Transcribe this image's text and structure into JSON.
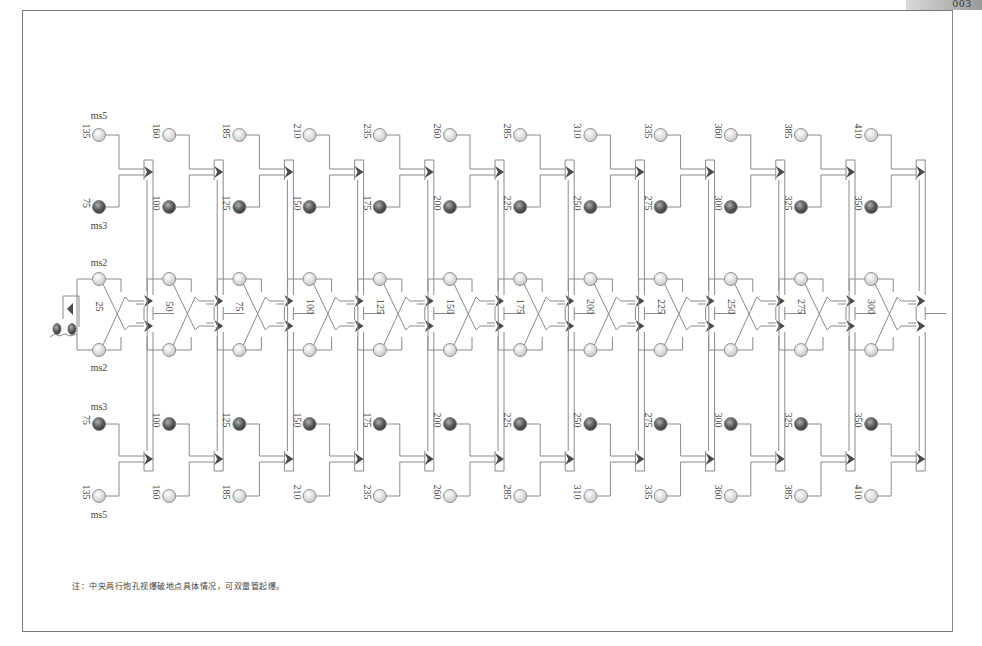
{
  "page": {
    "corner_tab": "003"
  },
  "diagram": {
    "type": "blasting-detonation-network",
    "column_count": 12,
    "delay_labels": {
      "top_outer": "ms5",
      "top_inner": "ms3",
      "center_top": "ms2",
      "center_bottom": "ms2",
      "bottom_inner": "ms3",
      "bottom_outer": "ms5"
    },
    "columns": [
      {
        "outer": "135",
        "inner": "75",
        "center": "25"
      },
      {
        "outer": "160",
        "inner": "100",
        "center": "50"
      },
      {
        "outer": "185",
        "inner": "125",
        "center": "75"
      },
      {
        "outer": "210",
        "inner": "150",
        "center": "100"
      },
      {
        "outer": "235",
        "inner": "175",
        "center": "125"
      },
      {
        "outer": "260",
        "inner": "200",
        "center": "150"
      },
      {
        "outer": "285",
        "inner": "225",
        "center": "175"
      },
      {
        "outer": "310",
        "inner": "250",
        "center": "200"
      },
      {
        "outer": "335",
        "inner": "275",
        "center": "225"
      },
      {
        "outer": "360",
        "inner": "300",
        "center": "250"
      },
      {
        "outer": "385",
        "inner": "325",
        "center": "275"
      },
      {
        "outer": "410",
        "inner": "350",
        "center": "300"
      }
    ],
    "colors": {
      "line": "#8a8a8a",
      "frame": "#7a7a7a",
      "connector": "#4a4a4a",
      "hole_light": "#e0e0e0",
      "hole_dark": "#6a6a6a",
      "text": "#444444"
    }
  },
  "note": "注：中央两行炮孔视爆破地点具体情况，可双雷管起爆。"
}
